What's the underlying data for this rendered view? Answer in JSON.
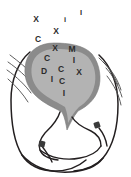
{
  "figure": {
    "kind": "anatomical-line-drawing",
    "background_color": "#ffffff",
    "outline_color": "#231f20",
    "organ_border_color": "#8b8b8b",
    "organ_fill_color": "#b3b3b3",
    "hatch_color": "#4d4d4d",
    "marker_color": "#3a3a3a",
    "annotation_color": "#2b2b2b"
  },
  "annotations": {
    "outside": [
      {
        "id": "x-upper-left",
        "text": "X",
        "x": 36,
        "y": 19,
        "size": 8.5
      },
      {
        "id": "i-upper-mid",
        "text": "i",
        "x": 65,
        "y": 20,
        "size": 7.5
      },
      {
        "id": "i-upper-right",
        "text": "I",
        "x": 81,
        "y": 13,
        "size": 7.5
      },
      {
        "id": "x-upper-mid",
        "text": "X",
        "x": 56,
        "y": 31,
        "size": 8.5
      },
      {
        "id": "c-upper-left",
        "text": "C",
        "x": 38,
        "y": 39,
        "size": 8.5
      }
    ],
    "on_organ_rim": [
      {
        "id": "x-rim-top",
        "text": "X",
        "x": 55,
        "y": 48,
        "size": 8.5
      },
      {
        "id": "m-rim-right",
        "text": "M",
        "x": 72,
        "y": 49,
        "size": 8.5
      }
    ],
    "inside": [
      {
        "id": "c-inner-top",
        "text": "C",
        "x": 47,
        "y": 58,
        "size": 8.5
      },
      {
        "id": "i-inner-right",
        "text": "I",
        "x": 74,
        "y": 60,
        "size": 8.5
      },
      {
        "id": "d-inner-left",
        "text": "D",
        "x": 44,
        "y": 71,
        "size": 8.5
      },
      {
        "id": "c-inner-mid",
        "text": "C",
        "x": 61,
        "y": 69,
        "size": 8.5
      },
      {
        "id": "x-inner-right",
        "text": "X",
        "x": 79,
        "y": 72,
        "size": 8.5
      },
      {
        "id": "i-inner-left",
        "text": "I",
        "x": 52,
        "y": 79,
        "size": 8.5
      },
      {
        "id": "c-inner-low",
        "text": "C",
        "x": 62,
        "y": 81,
        "size": 8.5
      },
      {
        "id": "i-inner-bottom",
        "text": "I",
        "x": 64,
        "y": 93,
        "size": 8.5
      }
    ]
  },
  "markers": [
    {
      "id": "marker-left",
      "x": 42,
      "y": 144
    },
    {
      "id": "marker-right",
      "x": 97,
      "y": 125
    }
  ]
}
